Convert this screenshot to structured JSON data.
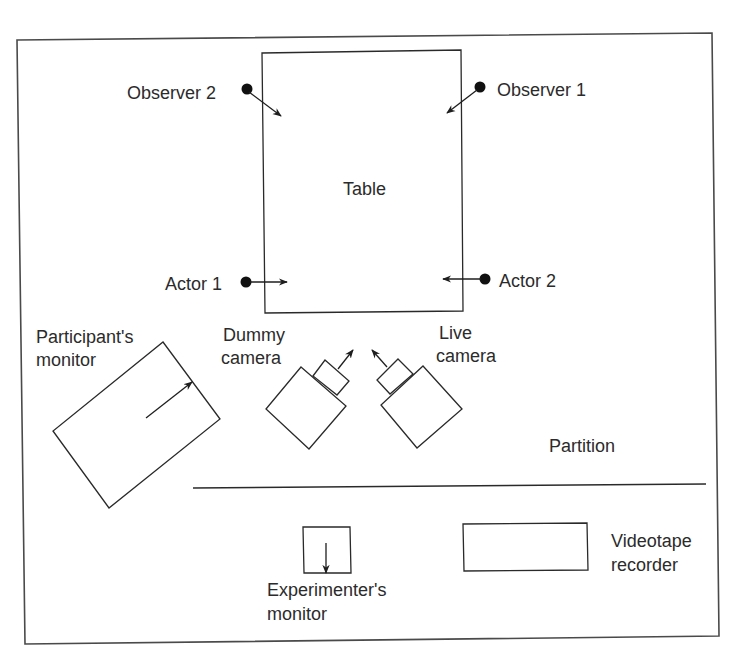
{
  "diagram": {
    "type": "experimental room layout",
    "labels": {
      "table": "Table",
      "observer_1": "Observer 1",
      "observer_2": "Observer 2",
      "actor_1": "Actor 1",
      "actor_2": "Actor 2",
      "participants_monitor_line1": "Participant's",
      "participants_monitor_line2": "monitor",
      "dummy_camera_line1": "Dummy",
      "dummy_camera_line2": "camera",
      "live_camera_line1": "Live",
      "live_camera_line2": "camera",
      "partition": "Partition",
      "experimenters_monitor_line1": "Experimenter's",
      "experimenters_monitor_line2": "monitor",
      "videotape_recorder_line1": "Videotape",
      "videotape_recorder_line2": "recorder"
    },
    "nodes": [
      {
        "id": "table",
        "label": "Table",
        "shape": "rectangle"
      },
      {
        "id": "observer_1",
        "label": "Observer 1",
        "shape": "dot",
        "faces": "table"
      },
      {
        "id": "observer_2",
        "label": "Observer 2",
        "shape": "dot",
        "faces": "table"
      },
      {
        "id": "actor_1",
        "label": "Actor 1",
        "shape": "dot",
        "faces": "table"
      },
      {
        "id": "actor_2",
        "label": "Actor 2",
        "shape": "dot",
        "faces": "table"
      },
      {
        "id": "participants_monitor",
        "label": "Participant's monitor",
        "shape": "rotated rectangle"
      },
      {
        "id": "dummy_camera",
        "label": "Dummy camera",
        "shape": "camera",
        "faces": "table"
      },
      {
        "id": "live_camera",
        "label": "Live camera",
        "shape": "camera",
        "faces": "table"
      },
      {
        "id": "partition",
        "label": "Partition",
        "shape": "line"
      },
      {
        "id": "experimenters_monitor",
        "label": "Experimenter's monitor",
        "shape": "rectangle"
      },
      {
        "id": "videotape_recorder",
        "label": "Videotape recorder",
        "shape": "rectangle"
      }
    ],
    "colors": {
      "stroke": "#2a2a2a",
      "text": "#2b2b2b",
      "background": "#ffffff"
    }
  }
}
